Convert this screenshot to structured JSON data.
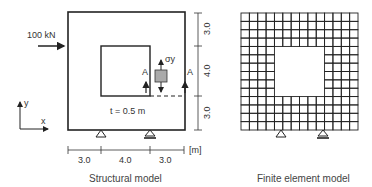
{
  "structural_model": {
    "caption": "Structural model",
    "load_label": "100 kN",
    "thickness_label": "t = 0.5 m",
    "section_label": "A",
    "stress_label": "σy",
    "axis_x_label": "x",
    "axis_y_label": "y",
    "unit_label": "[m]",
    "horizontal_dims": [
      "3.0",
      "4.0",
      "3.0"
    ],
    "vertical_dims": [
      "3.0",
      "4.0",
      "3.0"
    ]
  },
  "fe_model": {
    "caption": "Finite element model",
    "grid_divisions": 14
  }
}
